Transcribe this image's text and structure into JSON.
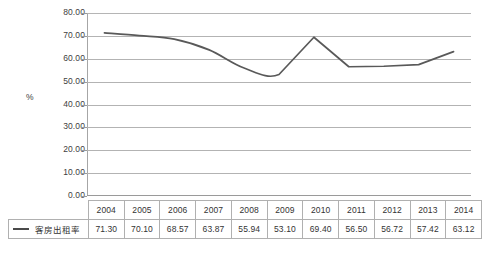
{
  "chart_data": {
    "type": "line",
    "title": "",
    "xlabel": "",
    "ylabel": "%",
    "ylim": [
      0,
      80
    ],
    "ytick_step": 10,
    "grid": true,
    "legend_position": "bottom-table",
    "categories": [
      "2004",
      "2005",
      "2006",
      "2007",
      "2008",
      "2009",
      "2010",
      "2011",
      "2012",
      "2013",
      "2014"
    ],
    "series": [
      {
        "name": "客房出租率",
        "color": "#595959",
        "values": [
          71.3,
          70.1,
          68.57,
          63.87,
          55.94,
          53.1,
          69.4,
          56.5,
          56.72,
          57.42,
          63.12
        ]
      }
    ],
    "ytick_labels": [
      "80.00",
      "70.00",
      "60.00",
      "50.00",
      "40.00",
      "30.00",
      "20.00",
      "10.00",
      "0.00"
    ],
    "ytick_values": [
      80,
      70,
      60,
      50,
      40,
      30,
      20,
      10,
      0
    ],
    "value_labels": [
      "71.30",
      "70.10",
      "68.57",
      "63.87",
      "55.94",
      "53.10",
      "69.40",
      "56.50",
      "56.72",
      "57.42",
      "63.12"
    ]
  },
  "axis": {
    "y_title": "%"
  },
  "table": {
    "legend_label": "客房出租率"
  },
  "colors": {
    "series_line": "#595959",
    "gridline": "#b3b3b3",
    "table_border": "#b0b0b0",
    "text": "#333333"
  }
}
